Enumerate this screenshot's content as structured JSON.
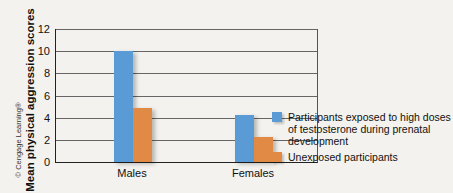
{
  "chart_data": {
    "type": "bar",
    "title": "",
    "xlabel": "",
    "ylabel": "Mean physical aggression scores",
    "ylim": [
      0,
      12
    ],
    "yticks": [
      0,
      2,
      4,
      6,
      8,
      10,
      12
    ],
    "grid": true,
    "legend_position": "right",
    "categories": [
      "Males",
      "Females"
    ],
    "series": [
      {
        "name": "Participants exposed to high doses of testosterone during prenatal development",
        "color": "#5b9bd5",
        "values": [
          10,
          4.2
        ]
      },
      {
        "name": "Unexposed participants",
        "color": "#e08a45",
        "values": [
          4.9,
          2.3
        ]
      }
    ],
    "annotations": [
      "© Cengage Learning®"
    ]
  },
  "labels": {
    "ylabel": "Mean physical aggression scores",
    "copyright": "© Cengage Learning®",
    "ticks": [
      "0",
      "2",
      "4",
      "6",
      "8",
      "10",
      "12"
    ],
    "categories": [
      "Males",
      "Females"
    ],
    "legend": [
      "Participants exposed to high doses of testosterone during prenatal development",
      "Unexposed participants"
    ]
  }
}
